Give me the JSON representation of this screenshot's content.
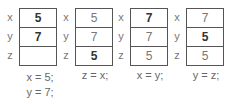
{
  "panels": [
    {
      "rows": [
        {
          "label": "x",
          "value": "5",
          "bold": true
        },
        {
          "label": "y",
          "value": "7",
          "bold": true
        },
        {
          "label": "z",
          "value": "",
          "bold": false
        }
      ],
      "caption": [
        "x = 5;",
        "y = 7;"
      ]
    },
    {
      "rows": [
        {
          "label": "x",
          "value": "5",
          "bold": false
        },
        {
          "label": "y",
          "value": "7",
          "bold": false
        },
        {
          "label": "z",
          "value": "5",
          "bold": true
        }
      ],
      "caption": [
        "z = x;"
      ]
    },
    {
      "rows": [
        {
          "label": "x",
          "value": "7",
          "bold": true
        },
        {
          "label": "y",
          "value": "7",
          "bold": false
        },
        {
          "label": "z",
          "value": "5",
          "bold": false
        }
      ],
      "caption": [
        "x = y;"
      ]
    },
    {
      "rows": [
        {
          "label": "x",
          "value": "7",
          "bold": false
        },
        {
          "label": "y",
          "value": "5",
          "bold": true
        },
        {
          "label": "z",
          "value": "5",
          "bold": false
        }
      ],
      "caption": [
        "y = z;"
      ]
    }
  ]
}
